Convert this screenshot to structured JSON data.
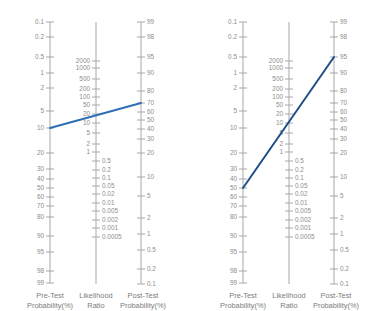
{
  "figure": {
    "title": "",
    "accent_color": "#2f6fb5",
    "accent_color_right": "#1d4f86",
    "axis_color": "#a8a8a8",
    "text_color": "#8d8d8d"
  },
  "axes": {
    "pretest": {
      "caption_line1": "Pre-Test",
      "caption_line2": "Probability(%)",
      "ticks": [
        "0.1",
        "0.2",
        "0.5",
        "1",
        "2",
        "5",
        "10",
        "20",
        "30",
        "40",
        "50",
        "60",
        "70",
        "80",
        "90",
        "95",
        "98",
        "99"
      ]
    },
    "likelihood": {
      "caption_line1": "Likelihood",
      "caption_line2": "Ratio",
      "ticks_upper": [
        "2000",
        "1000",
        "500",
        "200",
        "100",
        "50",
        "20",
        "10",
        "5",
        "2",
        "1"
      ],
      "ticks_lower": [
        "0.5",
        "0.2",
        "0.1",
        "0.05",
        "0.02",
        "0.01",
        "0.005",
        "0.002",
        "0.001",
        "0.0005"
      ]
    },
    "posttest": {
      "caption_line1": "Post-Test",
      "caption_line2": "Probability(%)",
      "ticks": [
        "99",
        "98",
        "95",
        "90",
        "80",
        "70",
        "60",
        "50",
        "40",
        "30",
        "20",
        "10",
        "5",
        "2",
        "1",
        "0.5",
        "0.2",
        "0.1"
      ]
    }
  },
  "chart_data": {
    "type": "line",
    "xlabel": "",
    "ylabel": "",
    "panels": [
      {
        "name": "left-nomogram",
        "pretest_probability": 10,
        "likelihood_ratio": 20,
        "posttest_probability": 70,
        "line_color": "#2f6fb5"
      },
      {
        "name": "right-nomogram",
        "pretest_probability": 50,
        "likelihood_ratio": 20,
        "posttest_probability": 95,
        "line_color": "#1d4f86"
      }
    ],
    "scales": {
      "pretest_values": [
        0.1,
        0.2,
        0.5,
        1,
        2,
        5,
        10,
        20,
        30,
        40,
        50,
        60,
        70,
        80,
        90,
        95,
        98,
        99
      ],
      "pretest_y": [
        22,
        37,
        57,
        73,
        88,
        111,
        128,
        153,
        169,
        179,
        188,
        197,
        206,
        217,
        236,
        252,
        271,
        283
      ],
      "likelihood_values": [
        2000,
        1000,
        500,
        200,
        100,
        50,
        20,
        10,
        5,
        2,
        1,
        0.5,
        0.2,
        0.1,
        0.05,
        0.02,
        0.01,
        0.005,
        0.002,
        0.001,
        0.0005
      ],
      "likelihood_y": [
        61,
        68,
        79,
        89,
        97,
        105,
        114,
        123,
        133,
        144,
        152,
        161,
        170,
        178,
        186,
        194,
        203,
        211,
        220,
        228,
        237
      ],
      "posttest_values": [
        99,
        98,
        95,
        90,
        80,
        70,
        60,
        50,
        40,
        30,
        20,
        10,
        5,
        2,
        1,
        0.5,
        0.2,
        0.1
      ],
      "posttest_y": [
        22,
        37,
        57,
        73,
        91,
        103,
        112,
        120,
        129,
        139,
        153,
        177,
        196,
        218,
        234,
        250,
        269,
        284
      ]
    },
    "grid": false,
    "legend_position": "none"
  }
}
